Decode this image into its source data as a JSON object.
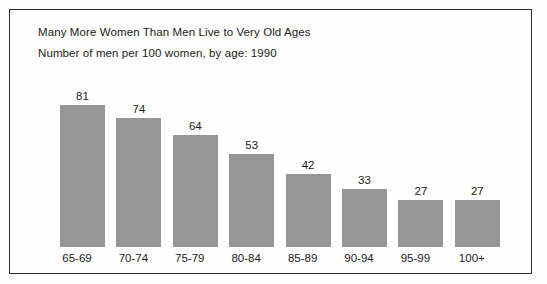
{
  "chart_data": {
    "type": "bar",
    "title": "Many More Women Than Men Live to Very Old Ages",
    "subtitle": "Number of men per 100 women, by age: 1990",
    "xlabel": "",
    "ylabel": "",
    "ylim": [
      0,
      100
    ],
    "grid": false,
    "legend": "none",
    "bar_color": "#969696",
    "categories": [
      "65-69",
      "70-74",
      "75-79",
      "80-84",
      "85-89",
      "90-94",
      "95-99",
      "100+"
    ],
    "values": [
      81,
      74,
      64,
      53,
      42,
      33,
      27,
      27
    ],
    "value_labels": [
      "81",
      "74",
      "64",
      "53",
      "42",
      "33",
      "27",
      "27"
    ],
    "data_labels_shown": true,
    "axis_line_shown": false,
    "y_axis_tick_labels": []
  },
  "frame": {
    "border_color": "#2b2b2b",
    "background": "#fefefe"
  }
}
